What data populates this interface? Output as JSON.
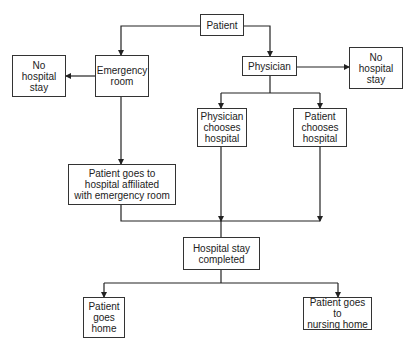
{
  "diagram": {
    "type": "flowchart",
    "nodes": {
      "patient": {
        "label": "Patient"
      },
      "emergency_room": {
        "label": "Emergency\nroom"
      },
      "no_stay_left": {
        "label": "No\nhospital\nstay"
      },
      "physician": {
        "label": "Physician"
      },
      "no_stay_right": {
        "label": "No\nhospital\nstay"
      },
      "physician_chooses": {
        "label": "Physician\nchooses\nhospital"
      },
      "patient_chooses": {
        "label": "Patient\nchooses\nhospital"
      },
      "affiliated": {
        "label": "Patient goes to\nhospital affiliated\nwith emergency room"
      },
      "stay_completed": {
        "label": "Hospital stay\ncompleted"
      },
      "goes_home": {
        "label": "Patient\ngoes\nhome"
      },
      "nursing_home": {
        "label": "Patient goes to\nnursing home"
      }
    },
    "edges": [
      [
        "patient",
        "emergency_room"
      ],
      [
        "patient",
        "physician"
      ],
      [
        "emergency_room",
        "no_stay_left"
      ],
      [
        "emergency_room",
        "affiliated"
      ],
      [
        "physician",
        "no_stay_right"
      ],
      [
        "physician",
        "physician_chooses"
      ],
      [
        "physician",
        "patient_chooses"
      ],
      [
        "affiliated",
        "stay_completed"
      ],
      [
        "physician_chooses",
        "stay_completed"
      ],
      [
        "patient_chooses",
        "stay_completed"
      ],
      [
        "stay_completed",
        "goes_home"
      ],
      [
        "stay_completed",
        "nursing_home"
      ]
    ]
  }
}
